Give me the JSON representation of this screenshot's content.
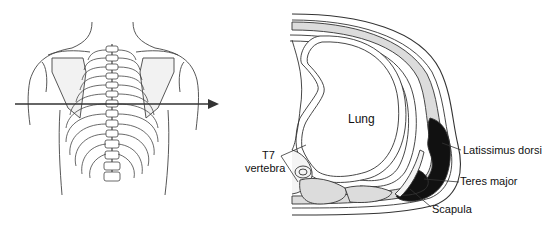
{
  "figure": {
    "left_panel": {
      "description": "posterior view of thorax with horizontal section-plane arrow"
    },
    "right_panel": {
      "description": "transverse section through left thoracic wall at T7 level",
      "labels": {
        "lung": "Lung",
        "t7_line1": "T7",
        "t7_line2": "vertebra",
        "latissimus": "Latissimus dorsi",
        "teres": "Teres major",
        "scapula": "Scapula"
      }
    },
    "colors": {
      "line": "#333333",
      "muscle_dark": "#111111",
      "muscle_fill": "#d8d8d8",
      "background": "#ffffff"
    }
  }
}
